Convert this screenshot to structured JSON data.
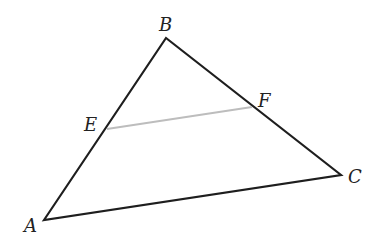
{
  "diagram": {
    "type": "triangle-with-segment",
    "colors": {
      "triangle_stroke": "#1e1e1e",
      "segment_stroke": "#bdbdbd",
      "label": "#222222",
      "background": "#ffffff"
    },
    "points": {
      "A": {
        "label": "A",
        "x": 44,
        "y": 220
      },
      "B": {
        "label": "B",
        "x": 166,
        "y": 38
      },
      "C": {
        "label": "C",
        "x": 341,
        "y": 175
      },
      "E": {
        "label": "E",
        "x": 107,
        "y": 129
      },
      "F": {
        "label": "F",
        "x": 252,
        "y": 107
      }
    },
    "segments": [
      {
        "from": "A",
        "to": "B",
        "style": "solid-dark"
      },
      {
        "from": "B",
        "to": "C",
        "style": "solid-dark"
      },
      {
        "from": "C",
        "to": "A",
        "style": "solid-dark"
      },
      {
        "from": "E",
        "to": "F",
        "style": "solid-light"
      }
    ],
    "labels": {
      "A": "A",
      "B": "B",
      "C": "C",
      "E": "E",
      "F": "F"
    }
  }
}
